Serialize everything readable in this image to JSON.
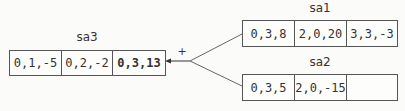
{
  "diagram": {
    "operator": "+",
    "arrays": {
      "sa3": {
        "name": "sa3",
        "cells": [
          "0,1,-5",
          "0,2,-2",
          "0,3,13"
        ],
        "highlighted_index": 2
      },
      "sa1": {
        "name": "sa1",
        "cells": [
          "0,3,8",
          "2,0,20",
          "3,3,-3"
        ]
      },
      "sa2": {
        "name": "sa2",
        "cells": [
          "0,3,5",
          "2,0,-15",
          ""
        ]
      }
    },
    "edges": [
      {
        "from": "sa1",
        "to": "junction"
      },
      {
        "from": "sa2",
        "to": "junction"
      },
      {
        "from": "junction",
        "to": "sa3",
        "arrow": true
      }
    ]
  }
}
